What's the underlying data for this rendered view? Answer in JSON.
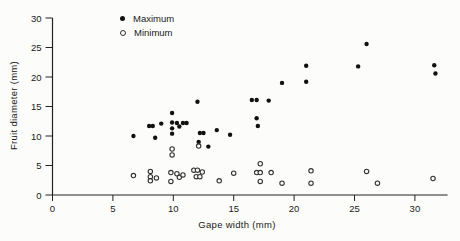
{
  "colors": {
    "ink": "#1a1a1a",
    "axis": "#222222",
    "point_fill": "#111111",
    "open_stroke": "#333333",
    "background": "#fcfcfb"
  },
  "legend": {
    "items": [
      {
        "label": "Maximum",
        "marker": "filled-circle"
      },
      {
        "label": "Minimum",
        "marker": "open-circle"
      }
    ]
  },
  "chart_data": {
    "type": "scatter",
    "title": "",
    "xlabel": "Gape width (mm)",
    "ylabel": "Fruit diameter (mm)",
    "xlim": [
      0,
      32.7
    ],
    "ylim": [
      0,
      30
    ],
    "xticks": [
      0,
      5,
      10,
      15,
      20,
      25,
      30
    ],
    "yticks": [
      0,
      5,
      10,
      15,
      20,
      25,
      30
    ],
    "grid": false,
    "legend_position": "top-inside",
    "series": [
      {
        "name": "Maximum",
        "marker": "filled-circle",
        "points": [
          [
            6.7,
            10.0
          ],
          [
            8.0,
            11.7
          ],
          [
            8.3,
            11.7
          ],
          [
            8.5,
            9.7
          ],
          [
            9.0,
            12.1
          ],
          [
            9.9,
            13.9
          ],
          [
            9.9,
            12.3
          ],
          [
            9.9,
            11.3
          ],
          [
            9.9,
            10.4
          ],
          [
            10.3,
            12.2
          ],
          [
            10.5,
            11.6
          ],
          [
            10.8,
            12.2
          ],
          [
            11.1,
            12.2
          ],
          [
            12.0,
            15.8
          ],
          [
            12.1,
            9.0
          ],
          [
            12.2,
            10.5
          ],
          [
            12.5,
            10.5
          ],
          [
            12.9,
            8.2
          ],
          [
            13.6,
            11.0
          ],
          [
            14.7,
            10.2
          ],
          [
            16.5,
            16.1
          ],
          [
            16.9,
            16.1
          ],
          [
            17.9,
            16.0
          ],
          [
            16.9,
            13.0
          ],
          [
            17.0,
            11.7
          ],
          [
            19.0,
            19.0
          ],
          [
            21.0,
            21.9
          ],
          [
            21.0,
            19.2
          ],
          [
            25.3,
            21.8
          ],
          [
            26.0,
            25.6
          ],
          [
            31.6,
            22.0
          ],
          [
            31.7,
            20.6
          ]
        ]
      },
      {
        "name": "Minimum",
        "marker": "open-circle",
        "points": [
          [
            6.7,
            3.3
          ],
          [
            8.1,
            4.0
          ],
          [
            8.1,
            3.1
          ],
          [
            8.1,
            2.4
          ],
          [
            8.6,
            2.9
          ],
          [
            9.9,
            7.8
          ],
          [
            9.9,
            6.8
          ],
          [
            9.8,
            3.8
          ],
          [
            9.8,
            2.3
          ],
          [
            10.3,
            3.6
          ],
          [
            10.5,
            3.0
          ],
          [
            10.8,
            3.4
          ],
          [
            11.7,
            4.2
          ],
          [
            12.0,
            4.2
          ],
          [
            11.9,
            3.1
          ],
          [
            12.2,
            3.1
          ],
          [
            12.4,
            3.9
          ],
          [
            12.1,
            8.3
          ],
          [
            13.8,
            2.4
          ],
          [
            15.0,
            3.7
          ],
          [
            16.9,
            3.8
          ],
          [
            17.2,
            3.8
          ],
          [
            18.1,
            3.8
          ],
          [
            17.2,
            5.3
          ],
          [
            17.2,
            2.3
          ],
          [
            19.0,
            2.0
          ],
          [
            21.4,
            4.1
          ],
          [
            21.4,
            2.0
          ],
          [
            26.0,
            4.0
          ],
          [
            26.9,
            2.0
          ],
          [
            31.5,
            2.8
          ]
        ]
      }
    ]
  }
}
